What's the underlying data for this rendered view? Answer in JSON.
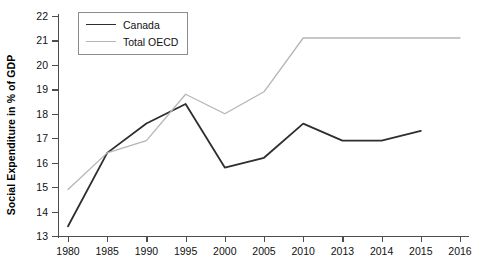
{
  "chart_data": {
    "type": "line",
    "title": "",
    "xlabel": "",
    "ylabel": "Social Expenditure in % of GDP",
    "categories": [
      "1980",
      "1985",
      "1990",
      "1995",
      "2000",
      "2005",
      "2010",
      "2013",
      "2014",
      "2015",
      "2016"
    ],
    "ylim": [
      13,
      22
    ],
    "yticks": [
      13,
      14,
      15,
      16,
      17,
      18,
      19,
      20,
      21,
      22
    ],
    "ytick_labels": [
      "13",
      "14",
      "15",
      "16",
      "17",
      "18",
      "19",
      "20",
      "21",
      "22"
    ],
    "grid": false,
    "legend_position": "top-left",
    "series": [
      {
        "name": "Canada",
        "color": "#2e2e2e",
        "values": [
          13.4,
          16.4,
          17.6,
          18.4,
          15.8,
          16.2,
          17.6,
          16.9,
          16.9,
          17.3,
          null
        ]
      },
      {
        "name": "Total OECD",
        "color": "#b5b5b5",
        "values": [
          14.9,
          16.4,
          16.9,
          18.8,
          18.0,
          18.9,
          21.1,
          21.1,
          21.1,
          21.1,
          21.1
        ]
      }
    ]
  },
  "legend": {
    "canada_label": "Canada",
    "oecd_label": "Total OECD"
  },
  "axes": {
    "y_title": "Social Expenditure in % of GDP"
  }
}
